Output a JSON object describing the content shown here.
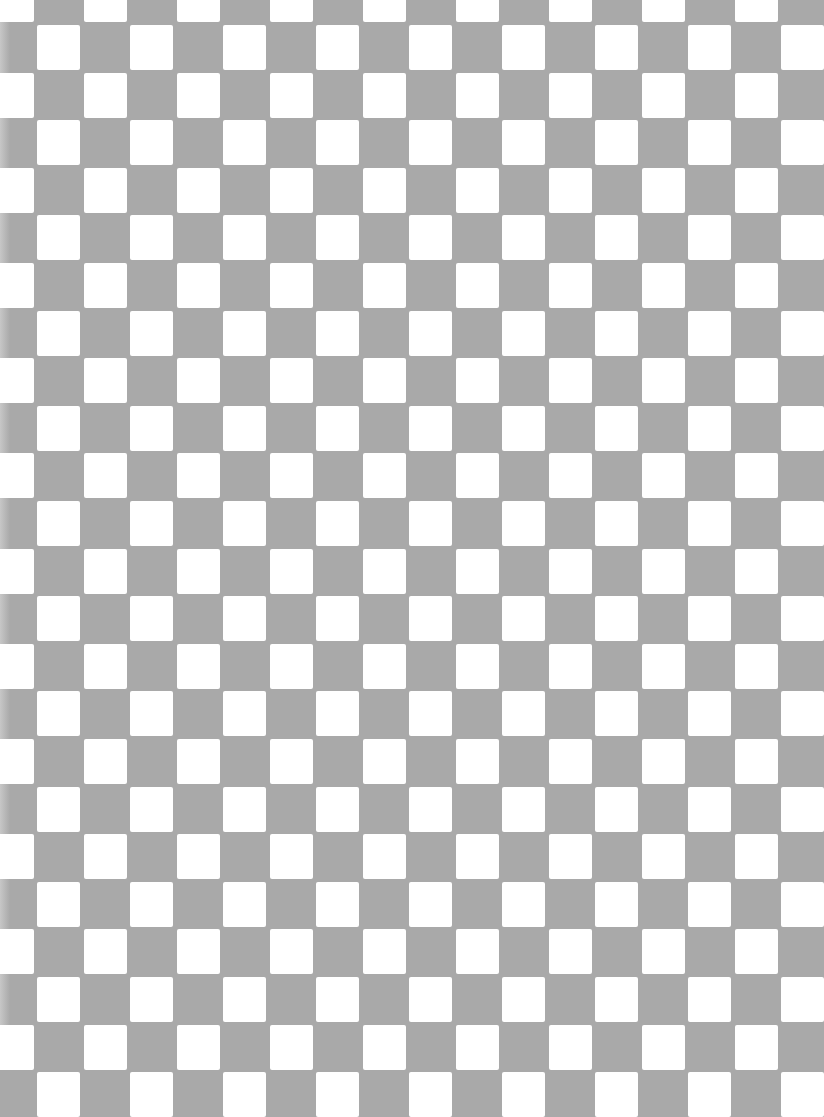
{
  "pattern": {
    "type": "checkerboard",
    "colors": {
      "dark": "#a9a9a9",
      "light": "#ffffff"
    },
    "cell_width": 46.5,
    "cell_height": 47.6,
    "square_size": 43,
    "columns": 18,
    "rows": 24
  }
}
